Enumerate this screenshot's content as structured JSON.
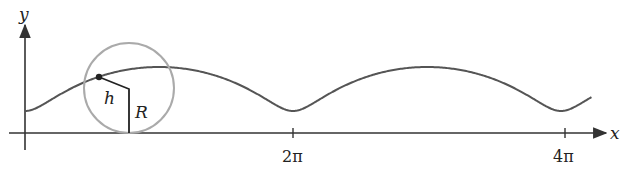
{
  "diagram": {
    "axes": {
      "x_label": "x",
      "y_label": "y",
      "ticks": [
        {
          "label": "2π",
          "value": 6.2832
        },
        {
          "label": "4π",
          "value": 12.5664
        }
      ]
    },
    "labels": {
      "h": "h",
      "R": "R"
    },
    "curve": {
      "type": "trochoid",
      "description": "path traced by a point at distance h from the center of a rolling circle of radius R (h < R)"
    },
    "colors": {
      "axis": "#333333",
      "curve": "#555555",
      "circle": "#aaaaaa",
      "segments": "#222222",
      "point": "#222222"
    }
  }
}
